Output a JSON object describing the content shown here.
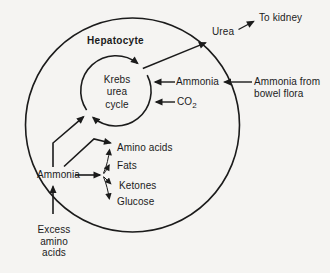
{
  "colors": {
    "ink": "#1b1b1b",
    "background": "#f5f4f2"
  },
  "cell": {
    "name": "Hepatocyte"
  },
  "cycle": {
    "lines": [
      "Krebs",
      "urea",
      "cycle"
    ]
  },
  "outputs": {
    "urea": "Urea",
    "to_kidney": "To kidney"
  },
  "inputs": {
    "ammonia": "Ammonia",
    "ammonia_source_line1": "Ammonia from",
    "ammonia_source_line2": "bowel flora",
    "co2_base": "CO",
    "co2_sub": "2"
  },
  "products": {
    "amino_acids": "Amino acids",
    "fats": "Fats",
    "ketones": "Ketones",
    "glucose": "Glucose"
  },
  "lower": {
    "ammonia": "Ammonia",
    "excess_line1": "Excess",
    "excess_line2": "amino",
    "excess_line3": "acids"
  }
}
